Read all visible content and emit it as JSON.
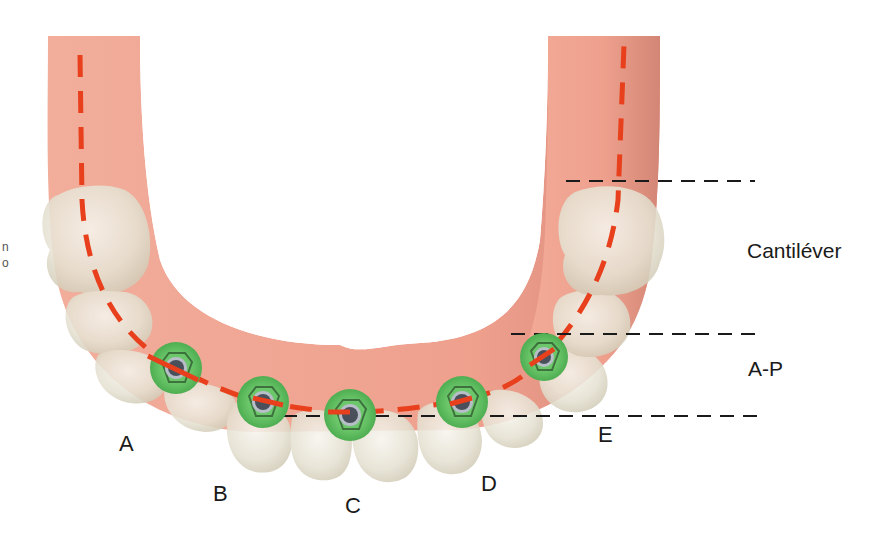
{
  "figure": {
    "colors": {
      "gum": "#f0a593",
      "gum_shadow": "#d98878",
      "tooth": "#ece9dc",
      "tooth_shadow": "#c9c2ad",
      "implant_ring": "#5cb85c",
      "implant_ring_dark": "#3f9a45",
      "implant_core": "#4a4f5c",
      "arch_curve": "#e8401c",
      "guide_line": "#1a1a1a",
      "background": "#ffffff"
    },
    "implants": [
      {
        "label": "A",
        "cx": 176,
        "cy": 368
      },
      {
        "label": "B",
        "cx": 263,
        "cy": 402
      },
      {
        "label": "C",
        "cx": 350,
        "cy": 415
      },
      {
        "label": "D",
        "cx": 462,
        "cy": 402
      },
      {
        "label": "E",
        "cx": 544,
        "cy": 357
      }
    ],
    "implant_labels": [
      {
        "text": "A",
        "x": 119,
        "y": 433
      },
      {
        "text": "B",
        "x": 213,
        "y": 483
      },
      {
        "text": "C",
        "x": 345,
        "y": 495
      },
      {
        "text": "D",
        "x": 481,
        "y": 473
      },
      {
        "text": "E",
        "x": 598,
        "y": 424
      }
    ],
    "measurement_labels": [
      {
        "name": "cantilever",
        "text": "Cantiléver",
        "x": 747,
        "y": 240
      },
      {
        "name": "a-p-spread",
        "text": "A-P",
        "x": 748,
        "y": 358
      }
    ],
    "guide_lines": [
      {
        "name": "cantilever-top-line",
        "x1": 566,
        "x2": 755,
        "y": 181
      },
      {
        "name": "ap-top-line",
        "x1": 511,
        "x2": 757,
        "y": 334
      },
      {
        "name": "ap-bottom-line",
        "x1": 283,
        "x2": 757,
        "y": 416
      }
    ],
    "edge_fragments": [
      "n",
      "o"
    ]
  }
}
